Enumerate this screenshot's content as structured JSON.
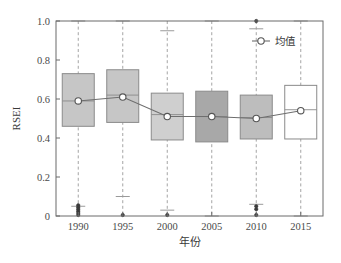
{
  "chart_data": {
    "type": "box",
    "title": "",
    "xlabel": "年份",
    "ylabel": "RSEI",
    "categories": [
      "1990",
      "1995",
      "2000",
      "2005",
      "2010",
      "2015"
    ],
    "ylim": [
      0,
      1.0
    ],
    "yticks": [
      0,
      0.2,
      0.4,
      0.6,
      0.8,
      1.0
    ],
    "ytick_labels": [
      "0",
      "0.2",
      "0.4",
      "0.6",
      "0.8",
      "1.0"
    ],
    "grid": "vertical-dashed-per-category",
    "legend": {
      "position": "top-right-inside",
      "entries": [
        {
          "label": "均值",
          "marker": "open-circle",
          "line": "solid"
        }
      ]
    },
    "series": [
      {
        "name": "均值",
        "values": [
          0.59,
          0.61,
          0.51,
          0.51,
          0.5,
          0.54
        ]
      }
    ],
    "boxes": [
      {
        "category": "1990",
        "q1": 0.46,
        "median": 0.59,
        "q3": 0.73,
        "whisker_low": 0.05,
        "whisker_high": 1.0,
        "mean": 0.59,
        "fill": "#c6c6c6",
        "outliers": [
          0.055,
          0.045,
          0.035,
          0.025,
          0.015,
          0.005
        ]
      },
      {
        "category": "1995",
        "q1": 0.48,
        "median": 0.62,
        "q3": 0.75,
        "whisker_low": 0.1,
        "whisker_high": 1.0,
        "mean": 0.61,
        "fill": "#c6c6c6",
        "outliers": [
          0.005
        ]
      },
      {
        "category": "2000",
        "q1": 0.39,
        "median": 0.52,
        "q3": 0.63,
        "whisker_low": 0.03,
        "whisker_high": 0.95,
        "mean": 0.51,
        "fill": "#cfcfcf",
        "outliers": [
          0.005
        ]
      },
      {
        "category": "2005",
        "q1": 0.38,
        "median": 0.51,
        "q3": 0.64,
        "whisker_low": 0.0,
        "whisker_high": 1.0,
        "mean": 0.51,
        "fill": "#a8a8a8",
        "outliers": []
      },
      {
        "category": "2010",
        "q1": 0.395,
        "median": 0.505,
        "q3": 0.62,
        "whisker_low": 0.06,
        "whisker_high": 0.96,
        "mean": 0.5,
        "fill": "#bdbdbd",
        "outliers": [
          1.0,
          0.05,
          0.035,
          0.005
        ]
      },
      {
        "category": "2015",
        "q1": 0.395,
        "median": 0.545,
        "q3": 0.67,
        "whisker_low": 0.0,
        "whisker_high": 1.0,
        "mean": 0.54,
        "fill": "#ffffff",
        "outliers": []
      }
    ],
    "colors": {
      "axis": "#6b6b6b",
      "box_edge": "#8a8a8a",
      "whisker": "#9a9a9a",
      "mean_line": "#6e6e6e",
      "mean_marker_fill": "#ffffff",
      "mean_marker_edge": "#555555",
      "outlier": "#3a3a3a",
      "text": "#3a3a3a"
    }
  }
}
